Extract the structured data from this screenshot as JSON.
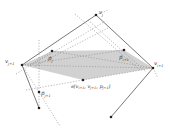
{
  "diagram": {
    "colors": {
      "shade": "#c8c8c8",
      "line": "#555555",
      "dotted": "#888888",
      "point": "#222222"
    },
    "labels": {
      "v_j": "v",
      "v_j_sub": "j",
      "v_j1": "v",
      "v_j1_sub": "j+1",
      "v_i1": "v",
      "v_i1_sub": "i+1",
      "p_j": "p̄",
      "p_j_sub": "j",
      "p_i1": "p̄",
      "p_i1_sub": "i+1",
      "p_j1": "p̄",
      "p_j1_sub": "j+1",
      "partial": "∂(v",
      "partial_sub1": "i+1",
      "partial_mid": ", v",
      "partial_sub2": "j+1",
      "partial_mid2": ", p",
      "partial_sub3": "j+1",
      "partial_end": ")"
    },
    "points": {
      "v_j": [
        96,
        15
      ],
      "v_j1": [
        22,
        65
      ],
      "v_i1": [
        153,
        68
      ],
      "p_j": [
        52,
        52
      ],
      "p_i1": [
        124,
        50
      ],
      "partial": [
        83,
        80
      ],
      "p_j1": [
        39,
        92
      ],
      "end_left": [
        39,
        108
      ],
      "end_right": [
        111,
        117
      ]
    }
  }
}
